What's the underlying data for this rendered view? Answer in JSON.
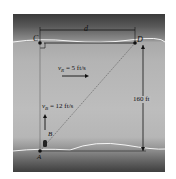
{
  "diagram": {
    "points": {
      "A": "A",
      "B": "B",
      "C": "C",
      "D": "D"
    },
    "labels": {
      "width": "d",
      "river_velocity": "v_R = 5 ft/s",
      "river_velocity_sym": "v",
      "river_velocity_sub": "R",
      "river_velocity_val": " = 5 ft/s",
      "boat_velocity_sym": "v",
      "boat_velocity_sub": "B",
      "boat_velocity_val": " = 12 ft/s",
      "distance": "160 ft"
    },
    "colors": {
      "ink": "#111111",
      "bank_line": "#f2f2f2",
      "water": "#bdbdbd",
      "bank": "#3a3a3a"
    }
  }
}
